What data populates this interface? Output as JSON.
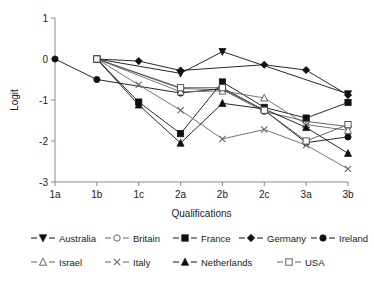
{
  "chart_data": {
    "type": "line",
    "title": "",
    "subtitle": "",
    "xlabel": "Qualifications",
    "ylabel": "Logit",
    "categories": [
      "1a",
      "1b",
      "1c",
      "2a",
      "2b",
      "2c",
      "3a",
      "3b"
    ],
    "x_tick_labels": [
      "1a",
      "1b",
      "1c",
      "2a",
      "2b",
      "2c",
      "3a",
      "3b"
    ],
    "y_tick_labels": [
      "1",
      "0",
      "-1",
      "-2",
      "-3"
    ],
    "y_ticks": [
      1,
      0,
      -1,
      -2,
      -3
    ],
    "ylim": [
      -3,
      1
    ],
    "grid": false,
    "legend_position": "bottom",
    "legend_columns": 5,
    "series": [
      {
        "name": "Australia",
        "marker": "triangle-down-filled",
        "color": "#111111",
        "filled": true,
        "values": [
          null,
          0.0,
          null,
          -0.35,
          0.18,
          null,
          null,
          -0.85
        ]
      },
      {
        "name": "Britain",
        "marker": "circle-open",
        "color": "#555555",
        "filled": false,
        "values": [
          null,
          0.0,
          null,
          -0.72,
          -0.75,
          -1.28,
          -1.52,
          -1.65
        ]
      },
      {
        "name": "France",
        "marker": "square-filled",
        "color": "#111111",
        "filled": true,
        "values": [
          null,
          0.0,
          -1.05,
          -1.82,
          -0.56,
          -1.18,
          -1.44,
          -1.06
        ]
      },
      {
        "name": "Germany",
        "marker": "diamond-filled",
        "color": "#111111",
        "filled": true,
        "values": [
          null,
          0.0,
          -0.05,
          -0.28,
          null,
          -0.14,
          -0.27,
          -0.88
        ]
      },
      {
        "name": "Ireland",
        "marker": "circle-filled",
        "color": "#111111",
        "filled": true,
        "values": [
          0.0,
          -0.5,
          null,
          -0.83,
          -0.72,
          -1.25,
          -2.04,
          -1.9
        ]
      },
      {
        "name": "Israel",
        "marker": "triangle-up-open",
        "color": "#666666",
        "filled": false,
        "values": [
          null,
          0.0,
          null,
          -0.8,
          -0.78,
          -0.95,
          -1.6,
          -1.74
        ]
      },
      {
        "name": "Italy",
        "marker": "x-cross",
        "color": "#666666",
        "filled": false,
        "values": [
          null,
          0.0,
          -0.63,
          -1.25,
          -1.95,
          -1.72,
          -2.1,
          -2.68
        ]
      },
      {
        "name": "Netherlands",
        "marker": "triangle-up-filled",
        "color": "#111111",
        "filled": true,
        "values": [
          null,
          0.0,
          -1.12,
          -2.05,
          -1.08,
          -1.22,
          -1.67,
          -2.3
        ]
      },
      {
        "name": "USA",
        "marker": "square-open",
        "color": "#555555",
        "filled": false,
        "values": [
          null,
          0.0,
          null,
          -0.7,
          -0.7,
          -1.25,
          -2.0,
          -1.6
        ]
      }
    ]
  },
  "legend": {
    "rows": [
      [
        {
          "name": "Australia",
          "marker": "triangle-down-filled"
        },
        {
          "name": "Britain",
          "marker": "circle-open"
        },
        {
          "name": "France",
          "marker": "square-filled"
        },
        {
          "name": "Germany",
          "marker": "diamond-filled"
        },
        {
          "name": "Ireland",
          "marker": "circle-filled"
        }
      ],
      [
        {
          "name": "Israel",
          "marker": "triangle-up-open"
        },
        {
          "name": "Italy",
          "marker": "x-cross"
        },
        {
          "name": "Netherlands",
          "marker": "triangle-up-filled"
        },
        {
          "name": "USA",
          "marker": "square-open"
        }
      ]
    ]
  }
}
